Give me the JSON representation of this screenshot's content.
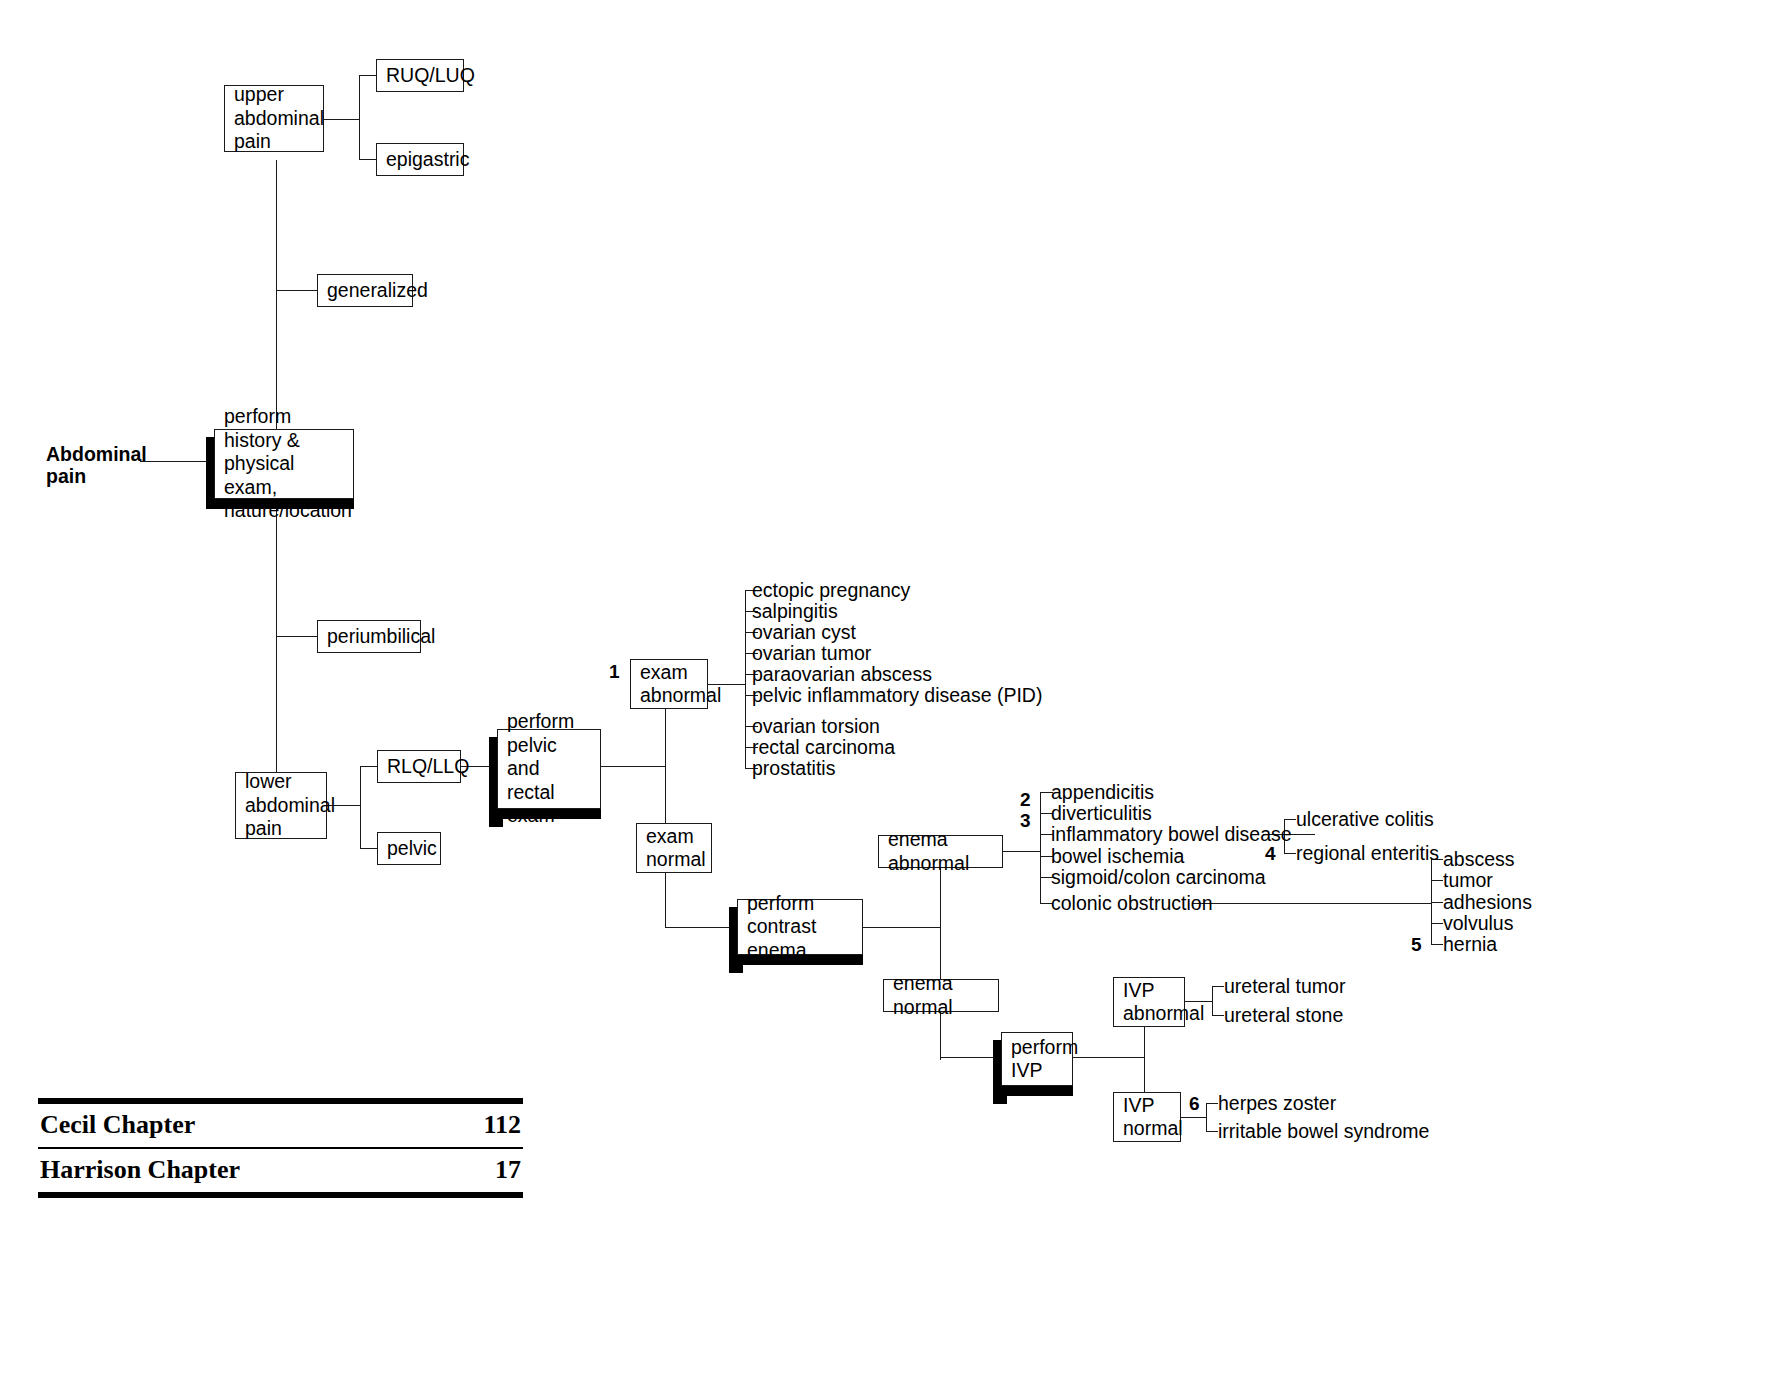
{
  "root": {
    "label": "Abdominal\npain"
  },
  "nodes": {
    "upper_abdominal_pain": "upper\nabdominal\npain",
    "ruq_luq": "RUQ/LUQ",
    "epigastric": "epigastric",
    "generalized": "generalized",
    "perform_history": "perform history\n& physical exam,\nnature/location",
    "periumbilical": "periumbilical",
    "lower_abdominal_pain": "lower\nabdominal\npain",
    "rlq_llq": "RLQ/LLQ",
    "pelvic": "pelvic",
    "perform_pelvic_rectal": "perform\npelvic and\nrectal exam",
    "exam_abnormal": "exam\nabnormal",
    "exam_normal": "exam\nnormal",
    "perform_contrast_enema": "perform\ncontrast enema",
    "enema_abnormal": "enema abnormal",
    "enema_normal": "enema normal",
    "perform_ivp": "perform\nIVP",
    "ivp_abnormal": "IVP\nabnormal",
    "ivp_normal": "IVP\nnormal"
  },
  "exam_abnormal_diagnoses": [
    "ectopic pregnancy",
    "salpingitis",
    "ovarian cyst",
    "ovarian tumor",
    "paraovarian abscess",
    "pelvic inflammatory disease (PID)",
    "ovarian torsion",
    "rectal carcinoma",
    "prostatitis"
  ],
  "enema_abnormal_diagnoses": [
    "appendicitis",
    "diverticulitis",
    "inflammatory bowel disease",
    "bowel ischemia",
    "sigmoid/colon carcinoma",
    "colonic obstruction"
  ],
  "ibd_subtypes": [
    "ulcerative colitis",
    "regional enteritis"
  ],
  "obstruction_causes": [
    "abscess",
    "tumor",
    "adhesions",
    "volvulus",
    "hernia"
  ],
  "ivp_abnormal_diagnoses": [
    "ureteral tumor",
    "ureteral stone"
  ],
  "ivp_normal_diagnoses": [
    "herpes zoster",
    "irritable bowel syndrome"
  ],
  "reference_numbers": {
    "n1": "1",
    "n2": "2",
    "n3": "3",
    "n4": "4",
    "n5": "5",
    "n6": "6"
  },
  "footer": {
    "rows": [
      {
        "label": "Cecil Chapter",
        "value": "112"
      },
      {
        "label": "Harrison Chapter",
        "value": "17"
      }
    ]
  },
  "colors": {
    "line": "#1a1a1a",
    "shadow": "#000000",
    "background": "#ffffff"
  }
}
